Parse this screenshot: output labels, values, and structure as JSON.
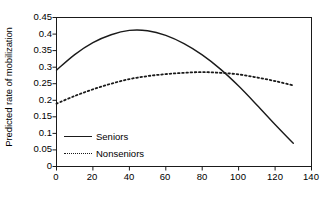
{
  "chart_data": {
    "type": "line",
    "title": "",
    "xlabel": "Income in thousands of 1996 dollars",
    "ylabel": "Predicted rate of mobilization",
    "xlim": [
      0,
      140
    ],
    "ylim": [
      0,
      0.45
    ],
    "grid": false,
    "legend_position": "inside-lower-left",
    "xticks": [
      "0",
      "20",
      "40",
      "60",
      "80",
      "100",
      "120",
      "140"
    ],
    "xtick_values": [
      0,
      20,
      40,
      60,
      80,
      100,
      120,
      140
    ],
    "yticks": [
      "0",
      "0.05",
      "0.1",
      "0.15",
      "0.2",
      "0.25",
      "0.3",
      "0.35",
      "0.4",
      "0.45"
    ],
    "ytick_values": [
      0,
      0.05,
      0.1,
      0.15,
      0.2,
      0.25,
      0.3,
      0.35,
      0.4,
      0.45
    ],
    "x": [
      0,
      10,
      20,
      30,
      40,
      50,
      60,
      70,
      80,
      90,
      100,
      110,
      120,
      130
    ],
    "series": [
      {
        "name": "Seniors",
        "style": "solid",
        "color": "#1a1a1a",
        "values": [
          0.291,
          0.338,
          0.374,
          0.398,
          0.411,
          0.41,
          0.396,
          0.371,
          0.337,
          0.294,
          0.243,
          0.186,
          0.127,
          0.07
        ]
      },
      {
        "name": "Nonseniors",
        "style": "dotted",
        "color": "#1a1a1a",
        "values": [
          0.19,
          0.213,
          0.233,
          0.25,
          0.264,
          0.273,
          0.279,
          0.283,
          0.285,
          0.283,
          0.278,
          0.269,
          0.258,
          0.245
        ]
      }
    ]
  },
  "legend": {
    "items": [
      {
        "label": "Seniors"
      },
      {
        "label": "Nonseniors"
      }
    ]
  },
  "axes": {
    "x_title": "Income in thousands of 1996 dollars",
    "y_title": "Predicted rate of mobilization"
  }
}
